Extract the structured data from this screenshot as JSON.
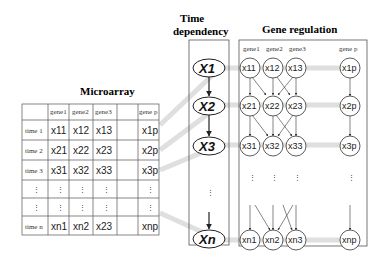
{
  "titles": {
    "microarray": "Microarray",
    "time_dependency_1": "Time",
    "time_dependency_2": "dependency",
    "gene_regulation": "Gene regulation"
  },
  "table": {
    "columns": [
      "gene1",
      "gene2",
      "gene3",
      "",
      "gene p"
    ],
    "rows": [
      {
        "label": "time 1",
        "cells": [
          "x11",
          "x12",
          "x13",
          "",
          "x1p"
        ]
      },
      {
        "label": "time 2",
        "cells": [
          "x21",
          "x22",
          "x23",
          "",
          "x2p"
        ]
      },
      {
        "label": "time 3",
        "cells": [
          "x31",
          "x32",
          "x33",
          "",
          "x3p"
        ]
      },
      {
        "label": "⋮",
        "cells": [
          "⋮",
          "⋮",
          "⋮",
          "",
          "⋮"
        ]
      },
      {
        "label": "⋮",
        "cells": [
          "⋮",
          "⋮",
          "⋮",
          "",
          "⋮"
        ]
      },
      {
        "label": "time n",
        "cells": [
          "xn1",
          "xn2",
          "x23",
          "",
          "xnp"
        ]
      }
    ]
  },
  "time_nodes": [
    "X1",
    "X2",
    "X3",
    "Xn"
  ],
  "gene_regulation": {
    "columns": [
      "gene1",
      "gene2",
      "gene3",
      "gene p"
    ],
    "rows": [
      [
        "x11",
        "x12",
        "x13",
        "x1p"
      ],
      [
        "x21",
        "x22",
        "x23",
        "x2p"
      ],
      [
        "x31",
        "x32",
        "x33",
        "x3p"
      ],
      [
        "xn1",
        "xn2",
        "xn3",
        "xnp"
      ]
    ]
  },
  "colors": {
    "connector": "#d9d9d9",
    "border": "#555555"
  }
}
